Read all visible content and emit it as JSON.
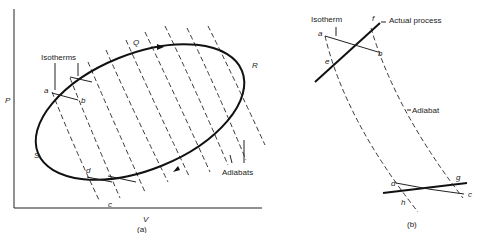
{
  "panel_a": {
    "caption": "(a)",
    "axes": {
      "x_label": "V",
      "y_label": "P"
    },
    "cycle_points": {
      "Q": "Q",
      "R": "R",
      "S": "S"
    },
    "points": {
      "a": "a",
      "b": "b",
      "c": "c",
      "d": "d"
    },
    "annotations": {
      "isotherms": "Isotherms",
      "adiabats": "Adiabats"
    }
  },
  "panel_b": {
    "caption": "(b)",
    "points": {
      "a": "a",
      "b": "b",
      "c": "c",
      "d": "d",
      "e": "e",
      "f": "f",
      "g": "g",
      "h": "h"
    },
    "annotations": {
      "isotherm": "Isotherm",
      "actual_process": "Actual process",
      "adiabat": "Adiabat"
    }
  },
  "colors": {
    "ink": "#222222",
    "background": "#ffffff"
  }
}
